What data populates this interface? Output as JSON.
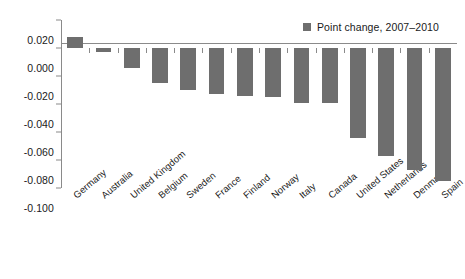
{
  "chart_data": {
    "type": "bar",
    "title": "",
    "subtitle": "",
    "xlabel": "",
    "ylabel": "",
    "ylim": [
      -0.1,
      0.02
    ],
    "ytick_labels": [
      "0.020",
      "0.000",
      "-0.020",
      "-0.040",
      "-0.060",
      "-0.080",
      "-0.100"
    ],
    "ytick_values": [
      0.02,
      0.0,
      -0.02,
      -0.04,
      -0.06,
      -0.08,
      -0.1
    ],
    "grid": false,
    "legend_position": "top-right",
    "legend": [
      {
        "label": "Point change, 2007–2010",
        "color": "#6e6e6e"
      }
    ],
    "series": [
      {
        "name": "Point change, 2007–2010",
        "color": "#6e6e6e",
        "values": [
          0.008,
          -0.003,
          -0.014,
          -0.025,
          -0.03,
          -0.033,
          -0.034,
          -0.035,
          -0.039,
          -0.039,
          -0.064,
          -0.077,
          -0.087,
          -0.095
        ]
      }
    ],
    "categories": [
      "Germany",
      "Australia",
      "United Kingdom",
      "Belgium",
      "Sweden",
      "France",
      "Finland",
      "Norway",
      "Italy",
      "Canada",
      "United States",
      "Netherlands",
      "Denmark",
      "Spain"
    ]
  },
  "colors": {
    "bar": "#6e6e6e",
    "axis": "#8a8a8a",
    "text": "#1a1a1a",
    "background": "#ffffff"
  }
}
